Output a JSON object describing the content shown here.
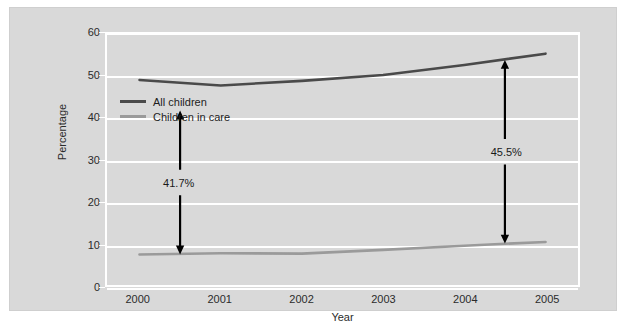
{
  "chart_data": {
    "type": "line",
    "title": "",
    "xlabel": "Year",
    "ylabel": "Percentage",
    "categories": [
      "2000",
      "2001",
      "2002",
      "2003",
      "2004",
      "2005"
    ],
    "x": [
      2000,
      2001,
      2002,
      2003,
      2004,
      2005
    ],
    "xlim": [
      1999.6,
      2005.4
    ],
    "ylim": [
      0,
      60
    ],
    "yticks": [
      0,
      10,
      20,
      30,
      40,
      50,
      60
    ],
    "ytick_labels": [
      "0",
      "10",
      "20",
      "30",
      "40",
      "50",
      "60"
    ],
    "grid": "horizontal",
    "legend_position": "inside-upper-left",
    "series": [
      {
        "name": "All children",
        "color": "#4a4a4a",
        "values": [
          49.0,
          47.7,
          48.8,
          50.2,
          52.6,
          55.3
        ]
      },
      {
        "name": "Children in care",
        "color": "#9a9a9a",
        "values": [
          7.3,
          7.6,
          7.5,
          8.4,
          9.4,
          10.3
        ]
      }
    ],
    "annotations": [
      {
        "label": "41.7%",
        "x": 2000.5,
        "y_top": 41.7,
        "y_bottom": 7.3,
        "style": "double-headed-arrow",
        "color": "#000000"
      },
      {
        "label": "45.5%",
        "x": 2004.5,
        "y_top": 53.8,
        "y_bottom": 9.9,
        "style": "double-headed-arrow",
        "color": "#000000"
      }
    ],
    "colors": {
      "panel_background": "#d9d9d9",
      "figure_background": "#ffffff",
      "gridline": "#ffffff",
      "text": "#2b2b2b"
    }
  }
}
